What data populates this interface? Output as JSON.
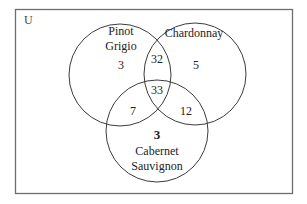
{
  "diagram": {
    "type": "venn-3",
    "universe_label": "U",
    "sets": [
      {
        "id": "pinot_grigio",
        "label_lines": [
          "Pinot",
          "Grigio"
        ]
      },
      {
        "id": "chardonnay",
        "label_lines": [
          "Chardonnay"
        ]
      },
      {
        "id": "cabernet_sauvignon",
        "label_lines": [
          "Cabernet",
          "Sauvignon"
        ]
      }
    ],
    "regions": {
      "pinot_grigio_only": "3",
      "chardonnay_only": "5",
      "cabernet_sauvignon_only": "3",
      "pinot_grigio_and_chardonnay_only": "32",
      "pinot_grigio_and_cabernet_only": "7",
      "chardonnay_and_cabernet_only": "12",
      "all_three": "33"
    },
    "colors": {
      "border": "#6e6e6e",
      "circle_stroke": "#3c3c3c",
      "text": "#222222",
      "background": "#ffffff"
    }
  }
}
